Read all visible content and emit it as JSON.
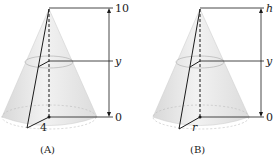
{
  "figures": [
    {
      "id": "A",
      "caption": "(A)",
      "top_label": "10",
      "mid_label": "y",
      "bottom_label": "0",
      "radius_label": "4",
      "top_italic": false,
      "radius_italic": false
    },
    {
      "id": "B",
      "caption": "(B)",
      "top_label": "h",
      "mid_label": "y",
      "bottom_label": "0",
      "radius_label": "r",
      "top_italic": true,
      "radius_italic": true
    }
  ],
  "colors": {
    "cone_fill": "#e6e6e6",
    "cone_edge": "#cfcfcf",
    "line": "#1a1a1a"
  }
}
